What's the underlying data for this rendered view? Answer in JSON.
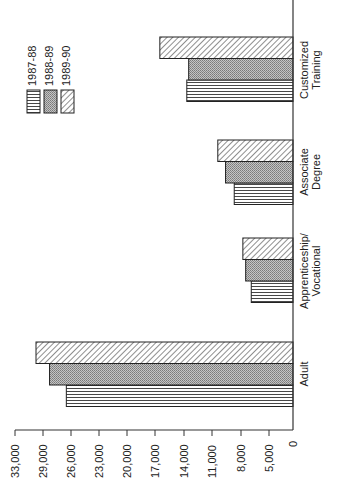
{
  "chart_data": {
    "type": "bar",
    "orientation": "rotated 90° counter-clockwise (vertical bar chart printed sideways)",
    "title": "",
    "xlabel": "",
    "ylabel": "",
    "categories": [
      "Adult",
      "Apprenticeship/ Vocational",
      "Associate Degree",
      "Customized Training"
    ],
    "category_lines": [
      [
        "Adult"
      ],
      [
        "Apprenticeship/",
        "Vocational"
      ],
      [
        "Associate",
        "Degree"
      ],
      [
        "Customized",
        "Training"
      ]
    ],
    "series": [
      {
        "name": "1987-88",
        "pattern": "horizontal-lines",
        "values": [
          26500,
          6900,
          8700,
          13700
        ]
      },
      {
        "name": "1988-89",
        "pattern": "dotted-gray",
        "values": [
          28300,
          7500,
          9600,
          13500
        ]
      },
      {
        "name": "1989-90",
        "pattern": "diagonal-hatch",
        "values": [
          30000,
          7800,
          10400,
          16500
        ]
      }
    ],
    "y_ticks": [
      "0",
      "5,000",
      "8,000",
      "11,000",
      "14,000",
      "17,000",
      "20,000",
      "23,000",
      "26,000",
      "29,000",
      "33,000"
    ],
    "y_tick_values": [
      0,
      5000,
      8000,
      11000,
      14000,
      17000,
      20000,
      23000,
      26000,
      29000,
      33000
    ],
    "ylim": [
      0,
      33000
    ],
    "grid": false,
    "legend": {
      "position": "upper-left (rotated)",
      "entries": [
        "1987-88",
        "1988-89",
        "1989-90"
      ]
    }
  },
  "colors": {
    "axis": "#333333",
    "bar_outline": "#222222",
    "lines_fill": "#ffffff",
    "dotted_fill": "#b8b8b8",
    "hatch_fill": "#ffffff"
  }
}
